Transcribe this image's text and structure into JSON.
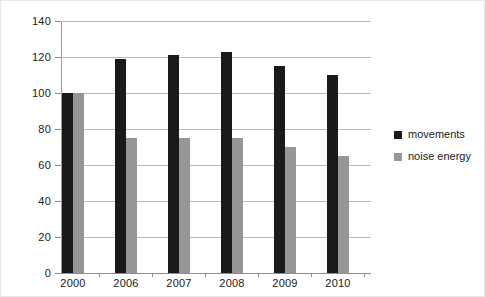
{
  "chart_data": {
    "type": "bar",
    "title": "",
    "subtitle": "",
    "xlabel": "",
    "ylabel": "",
    "categories": [
      "2000",
      "2006",
      "2007",
      "2008",
      "2009",
      "2010"
    ],
    "series": [
      {
        "name": "movements",
        "color": "#1a1a1a",
        "values": [
          100,
          119,
          121,
          123,
          115,
          110
        ]
      },
      {
        "name": "noise energy",
        "color": "#969696",
        "values": [
          100,
          75,
          75,
          75,
          70,
          65
        ]
      }
    ],
    "ylim": [
      0,
      140
    ],
    "yticks": [
      0,
      20,
      40,
      60,
      80,
      100,
      120,
      140
    ],
    "ytick_labels": [
      "0",
      "20",
      "40",
      "60",
      "80",
      "100",
      "120",
      "140"
    ],
    "grid": true,
    "grid_axis": "y",
    "legend_position": "right",
    "annotations": []
  },
  "legend": {
    "entries": [
      {
        "label": "movements",
        "color": "#1a1a1a"
      },
      {
        "label": "noise energy",
        "color": "#969696"
      }
    ]
  },
  "colors": {
    "movements": "#1a1a1a",
    "noise_energy": "#969696",
    "gridline": "#b9b9b9",
    "axis": "#8d8d8d",
    "background": "#ffffff",
    "text": "#1a1a1a"
  }
}
